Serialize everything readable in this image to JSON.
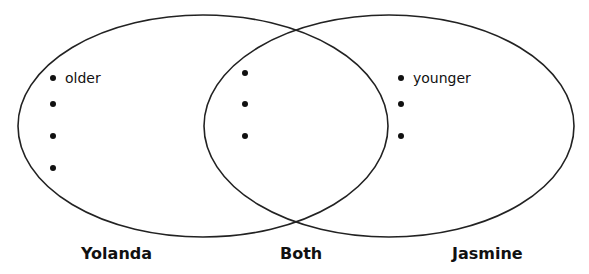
{
  "venn": {
    "left": {
      "title": "Yolanda",
      "items": [
        "older",
        "",
        "",
        ""
      ]
    },
    "middle": {
      "title": "Both",
      "items": [
        "",
        "",
        ""
      ]
    },
    "right": {
      "title": "Jasmine",
      "items": [
        "younger",
        "",
        ""
      ]
    },
    "stroke_color": "#222222"
  }
}
